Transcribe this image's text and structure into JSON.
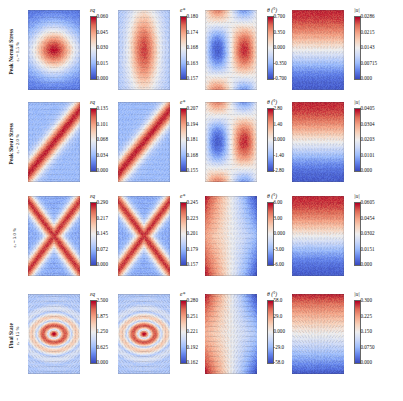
{
  "figure": {
    "type": "field-plot-grid",
    "rows": 4,
    "columns": 4,
    "colormap": "blue-white-red diverging (coolwarm)",
    "colormap_low_color": "#3b4cc0",
    "colormap_mid_color": "#dddddd",
    "colormap_high_color": "#b40426",
    "background": "#ffffff"
  },
  "rows": [
    {
      "id": "peak-normal-stress",
      "label_main": "Peak Normal Stress",
      "label_sub": "εₐ = 1.5 %",
      "panels": [
        {
          "id": "r1c1",
          "quantity": "eq",
          "cbar_title": "εq",
          "ticks": [
            "0.060",
            "0.045",
            "0.030",
            "0.015",
            "0.000"
          ],
          "range": [
            0.0,
            0.06
          ],
          "pattern": "corner-blue-center-red-lens",
          "vectors": true
        },
        {
          "id": "r1c2",
          "quantity": "e_star",
          "cbar_title": "e*",
          "ticks": [
            "0.180",
            "0.174",
            "0.168",
            "0.163",
            "0.157"
          ],
          "range": [
            0.157,
            0.18
          ],
          "pattern": "central-vertical-red-band",
          "vectors": true
        },
        {
          "id": "r1c3",
          "quantity": "theta",
          "cbar_title": "θ (°)",
          "ticks": [
            "0.700",
            "0.350",
            "0.000",
            "-0.350",
            "-0.700"
          ],
          "range": [
            -0.7,
            0.7
          ],
          "pattern": "diagonal-quadrants",
          "vectors": true
        },
        {
          "id": "r1c4",
          "quantity": "u_mag",
          "cbar_title": "|u|",
          "ticks": [
            "0.0286",
            "0.0215",
            "0.0143",
            "0.00715",
            "0.000"
          ],
          "range": [
            0.0,
            0.0286
          ],
          "pattern": "top-bottom-red-middle-white",
          "vectors": true
        }
      ]
    },
    {
      "id": "peak-shear-stress",
      "label_main": "Peak Shear Stress",
      "label_sub": "εₐ = 2.0 %",
      "panels": [
        {
          "id": "r2c1",
          "quantity": "eq",
          "cbar_title": "εq",
          "ticks": [
            "0.135",
            "0.101",
            "0.068",
            "0.034",
            "0.000"
          ],
          "range": [
            0.0,
            0.135
          ],
          "pattern": "single-diagonal-shear-band",
          "vectors": true
        },
        {
          "id": "r2c2",
          "quantity": "e_star",
          "cbar_title": "e*",
          "ticks": [
            "0.207",
            "0.194",
            "0.181",
            "0.168",
            "0.155"
          ],
          "range": [
            0.155,
            0.207
          ],
          "pattern": "single-diagonal-shear-band",
          "vectors": true
        },
        {
          "id": "r2c3",
          "quantity": "theta",
          "cbar_title": "θ (°)",
          "ticks": [
            "2.80",
            "1.40",
            "0.000",
            "-1.40",
            "-2.80"
          ],
          "range": [
            -2.8,
            2.8
          ],
          "pattern": "diagonal-quadrants",
          "vectors": true
        },
        {
          "id": "r2c4",
          "quantity": "u_mag",
          "cbar_title": "|u|",
          "ticks": [
            "0.0405",
            "0.0304",
            "0.0203",
            "0.0101",
            "0.000"
          ],
          "range": [
            0.0,
            0.0405
          ],
          "pattern": "top-bottom-red-middle-white",
          "vectors": true
        }
      ]
    },
    {
      "id": "post-peak",
      "label_main": "",
      "label_sub": "εₐ = 3.0 %",
      "panels": [
        {
          "id": "r3c1",
          "quantity": "eq",
          "cbar_title": "εq",
          "ticks": [
            "0.290",
            "0.217",
            "0.145",
            "0.072",
            "0.000"
          ],
          "range": [
            0.0,
            0.29
          ],
          "pattern": "conjugate-X-shear-bands",
          "vectors": true
        },
        {
          "id": "r3c2",
          "quantity": "e_star",
          "cbar_title": "e*",
          "ticks": [
            "0.245",
            "0.223",
            "0.201",
            "0.179",
            "0.157"
          ],
          "range": [
            0.157,
            0.245
          ],
          "pattern": "conjugate-X-shear-bands",
          "vectors": true
        },
        {
          "id": "r3c3",
          "quantity": "theta",
          "cbar_title": "θ (°)",
          "ticks": [
            "6.00",
            "3.00",
            "0.000",
            "-3.00",
            "-6.00"
          ],
          "range": [
            -6.0,
            6.0
          ],
          "pattern": "left-red-right-blue",
          "vectors": true
        },
        {
          "id": "r3c4",
          "quantity": "u_mag",
          "cbar_title": "|u|",
          "ticks": [
            "0.0605",
            "0.0454",
            "0.0302",
            "0.0151",
            "0.000"
          ],
          "range": [
            0.0,
            0.0605
          ],
          "pattern": "top-bottom-red-middle-white",
          "vectors": true
        }
      ]
    },
    {
      "id": "final-state",
      "label_main": "Final State",
      "label_sub": "εₐ = 15 %",
      "panels": [
        {
          "id": "r4c1",
          "quantity": "eq",
          "cbar_title": "εq",
          "ticks": [
            "2.500",
            "1.875",
            "1.250",
            "0.625",
            "0.000"
          ],
          "range": [
            0.0,
            2.5
          ],
          "pattern": "localized-bulge-bands",
          "vectors": true
        },
        {
          "id": "r4c2",
          "quantity": "e_star",
          "cbar_title": "e*",
          "ticks": [
            "0.280",
            "0.251",
            "0.221",
            "0.192",
            "0.162"
          ],
          "range": [
            0.162,
            0.28
          ],
          "pattern": "localized-bulge-bands",
          "vectors": true
        },
        {
          "id": "r4c3",
          "quantity": "theta",
          "cbar_title": "θ (°)",
          "ticks": [
            "58.0",
            "29.0",
            "0.000",
            "-29.0",
            "-58.0"
          ],
          "range": [
            -58.0,
            58.0
          ],
          "pattern": "left-red-right-blue",
          "vectors": true
        },
        {
          "id": "r4c4",
          "quantity": "u_mag",
          "cbar_title": "|u|",
          "ticks": [
            "0.300",
            "0.225",
            "0.150",
            "0.0750",
            "0.000"
          ],
          "range": [
            0.0,
            0.3
          ],
          "pattern": "top-red-bottom-blue",
          "vectors": true
        }
      ]
    }
  ]
}
